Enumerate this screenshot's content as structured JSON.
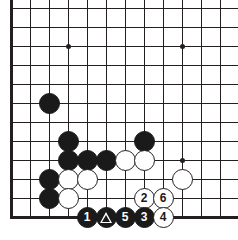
{
  "diagram": {
    "board_size": 19,
    "view": "bottom-left corner",
    "geometry": {
      "origin_x": 11,
      "origin_y": 217,
      "spacing": 19,
      "cols_visible": 12,
      "rows_visible": 11,
      "stone_radius": 10.5
    },
    "colors": {
      "line": "#231f20",
      "black_stone": "#1a1a1a",
      "white_stone": "#ffffff",
      "board_background": "#ffffff",
      "black_label": "#ffffff",
      "white_label": "#1a1a1a"
    },
    "edges": {
      "left_edge_thick": true,
      "bottom_edge_thick": true,
      "top_clipped": true,
      "right_clipped": true
    },
    "hoshi": [
      {
        "col": 3,
        "row": 3,
        "name": "star-point-d4"
      },
      {
        "col": 9,
        "row": 3,
        "name": "star-point-k4"
      },
      {
        "col": 3,
        "row": 9,
        "name": "star-point-d16"
      },
      {
        "col": 9,
        "row": 9,
        "name": "star-point-k16"
      }
    ],
    "stones": [
      {
        "col": 2,
        "row": 6,
        "color": "black",
        "label": "",
        "marker": "none",
        "name": "stone-black-c7"
      },
      {
        "col": 3,
        "row": 4,
        "color": "black",
        "label": "",
        "marker": "none",
        "name": "stone-black-d5"
      },
      {
        "col": 3,
        "row": 3,
        "color": "black",
        "label": "",
        "marker": "none",
        "name": "stone-black-d4"
      },
      {
        "col": 4,
        "row": 3,
        "color": "black",
        "label": "",
        "marker": "none",
        "name": "stone-black-e4"
      },
      {
        "col": 5,
        "row": 3,
        "color": "black",
        "label": "",
        "marker": "none",
        "name": "stone-black-f4"
      },
      {
        "col": 7,
        "row": 4,
        "color": "black",
        "label": "",
        "marker": "none",
        "name": "stone-black-h5"
      },
      {
        "col": 6,
        "row": 3,
        "color": "white",
        "label": "",
        "marker": "none",
        "name": "stone-white-g4"
      },
      {
        "col": 7,
        "row": 3,
        "color": "white",
        "label": "",
        "marker": "none",
        "name": "stone-white-h4"
      },
      {
        "col": 9,
        "row": 2,
        "color": "white",
        "label": "",
        "marker": "none",
        "name": "stone-white-k3"
      },
      {
        "col": 2,
        "row": 2,
        "color": "black",
        "label": "",
        "marker": "none",
        "name": "stone-black-c3"
      },
      {
        "col": 2,
        "row": 1,
        "color": "black",
        "label": "",
        "marker": "none",
        "name": "stone-black-c2"
      },
      {
        "col": 3,
        "row": 2,
        "color": "white",
        "label": "",
        "marker": "none",
        "name": "stone-white-d3"
      },
      {
        "col": 4,
        "row": 2,
        "color": "white",
        "label": "",
        "marker": "none",
        "name": "stone-white-e3"
      },
      {
        "col": 3,
        "row": 1,
        "color": "white",
        "label": "",
        "marker": "none",
        "name": "stone-white-d2"
      },
      {
        "col": 7,
        "row": 1,
        "color": "white",
        "label": "2",
        "marker": "number",
        "name": "stone-white-move-2"
      },
      {
        "col": 8,
        "row": 1,
        "color": "white",
        "label": "6",
        "marker": "number",
        "name": "stone-white-move-6"
      },
      {
        "col": 4,
        "row": 0,
        "color": "black",
        "label": "1",
        "marker": "number",
        "name": "stone-black-move-1"
      },
      {
        "col": 5,
        "row": 0,
        "color": "black",
        "label": "",
        "marker": "triangle",
        "name": "stone-black-marked-triangle"
      },
      {
        "col": 6,
        "row": 0,
        "color": "black",
        "label": "5",
        "marker": "number",
        "name": "stone-black-move-5"
      },
      {
        "col": 7,
        "row": 0,
        "color": "black",
        "label": "3",
        "marker": "number",
        "name": "stone-black-move-3"
      },
      {
        "col": 8,
        "row": 0,
        "color": "white",
        "label": "4",
        "marker": "number",
        "name": "stone-white-move-4"
      }
    ],
    "move_sequence": [
      "1",
      "2",
      "3",
      "4",
      "5",
      "6"
    ],
    "marked_stone_symbol": "triangle"
  }
}
